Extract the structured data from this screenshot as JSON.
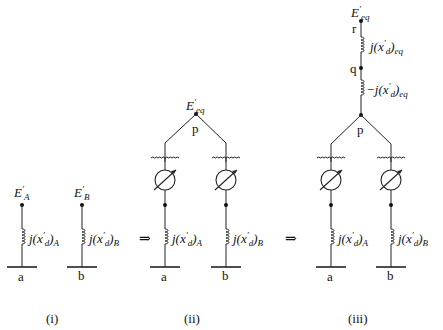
{
  "diagram": {
    "panels": [
      {
        "caption": "(i)",
        "branches": [
          {
            "source": "E'_A",
            "source_sym": "E",
            "source_sub": "A",
            "reactance": "j(x'_d)_A",
            "reactance_sub": "A",
            "bus": "a"
          },
          {
            "source": "E'_B",
            "source_sym": "E",
            "source_sub": "B",
            "reactance": "j(x'_d)_B",
            "reactance_sub": "B",
            "bus": "b"
          }
        ]
      },
      {
        "caption": "(ii)",
        "common_node": "p",
        "source": "E'_eq",
        "source_sub": "eq",
        "branches": [
          {
            "element": "phase-shifting transformer",
            "reactance": "j(x'_d)_A",
            "reactance_sub": "A",
            "bus": "a"
          },
          {
            "element": "phase-shifting transformer",
            "reactance": "j(x'_d)_B",
            "reactance_sub": "B",
            "bus": "b"
          }
        ]
      },
      {
        "caption": "(iii)",
        "source": "E'_eq",
        "source_sub": "eq",
        "nodes": {
          "r": "r",
          "q": "q",
          "p": "p"
        },
        "series": [
          {
            "reactance": "j(x'_d)_eq",
            "prefix": "j(x",
            "sub": "eq"
          },
          {
            "reactance": "-j(x'_d)_eq",
            "prefix": "−j(x",
            "sub": "eq"
          }
        ],
        "branches": [
          {
            "element": "phase-shifting transformer",
            "reactance": "j(x'_d)_A",
            "reactance_sub": "A",
            "bus": "a"
          },
          {
            "element": "phase-shifting transformer",
            "reactance": "j(x'_d)_B",
            "reactance_sub": "B",
            "bus": "b"
          }
        ]
      }
    ],
    "arrows": [
      "⇒",
      "⇒"
    ],
    "labels": {
      "E": "E",
      "prime": "′",
      "j_open": "j(x",
      "d": "d",
      "close": ")",
      "a": "a",
      "b": "b",
      "p": "p",
      "q": "q",
      "r": "r",
      "neg_j_open": "−j(x"
    }
  }
}
